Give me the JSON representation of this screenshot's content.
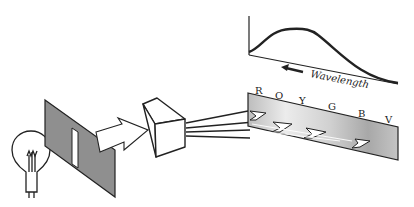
{
  "diagram": {
    "components": [
      {
        "id": "bulb",
        "label": "light-bulb"
      },
      {
        "id": "slit",
        "label": "slit-screen"
      },
      {
        "id": "prism",
        "label": "prism"
      },
      {
        "id": "spectrum",
        "label": "spectrum-screen"
      },
      {
        "id": "graph",
        "label": "intensity-vs-wavelength-graph"
      }
    ],
    "spectrum_labels": [
      "R",
      "O",
      "Y",
      "G",
      "B",
      "V"
    ],
    "graph": {
      "axis_label": "Wavelength",
      "arrow_direction": "left"
    },
    "colors": {
      "line": "#222222",
      "screen_fill": "#8a8a8a",
      "spectrum_light": "#e6e6e6",
      "spectrum_dark": "#9a9a9a"
    }
  }
}
